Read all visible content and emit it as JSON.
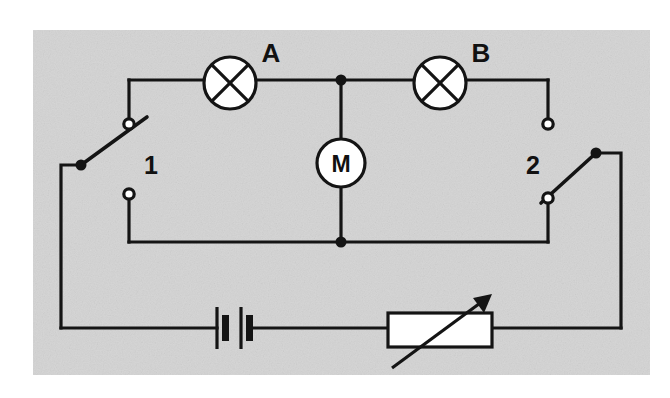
{
  "figure": {
    "kind": "electrical-circuit-schematic",
    "background_color": "#ffffff",
    "panel_color": "#d3d3d3",
    "line_color": "#141414",
    "component_fill": "#ffffff",
    "panel": {
      "x": 33,
      "y": 30,
      "width": 617,
      "height": 345
    }
  },
  "labels": {
    "lamp_a": "A",
    "lamp_b": "B",
    "motor": "M",
    "switch_one": "1",
    "switch_two": "2"
  },
  "components": {
    "lamp_a": {
      "name": "lamp-a",
      "symbol": "lamp",
      "label": "A",
      "center_x": 230,
      "center_y": 83,
      "radius": 26,
      "label_x": 271,
      "label_y": 60
    },
    "lamp_b": {
      "name": "lamp-b",
      "symbol": "lamp",
      "label": "B",
      "center_x": 440,
      "center_y": 83,
      "radius": 26,
      "label_x": 481,
      "label_y": 60
    },
    "motor": {
      "name": "motor",
      "symbol": "motor",
      "label": "M",
      "center_x": 341,
      "center_y": 163,
      "radius": 24,
      "label_x": 341,
      "label_y": 172
    },
    "battery": {
      "name": "battery",
      "symbol": "battery-two-cell",
      "center_x": 233,
      "center_y": 328,
      "long_plate_half_height": 21,
      "short_plate_half_height": 13,
      "plate_x": [
        216,
        224,
        241,
        249
      ]
    },
    "rheostat": {
      "name": "rheostat",
      "symbol": "variable-resistor",
      "x": 388,
      "y": 313,
      "width": 104,
      "height": 34,
      "arrow_from_x": 392,
      "arrow_from_y": 368,
      "arrow_to_x": 491,
      "arrow_to_y": 295
    },
    "switch_one": {
      "name": "switch-1",
      "symbol": "spdt-switch",
      "label": "1",
      "label_x": 144,
      "label_y": 172,
      "pivot_x": 81,
      "pivot_y": 165,
      "blade_tip_x": 146,
      "blade_tip_y": 118,
      "upper_terminal_x": 129,
      "upper_terminal_y": 124,
      "lower_terminal_x": 129,
      "lower_terminal_y": 194,
      "terminal_radius": 5
    },
    "switch_two": {
      "name": "switch-2",
      "symbol": "spdt-switch",
      "label": "2",
      "label_x": 535,
      "label_y": 172,
      "pivot_x": 596,
      "pivot_y": 153,
      "blade_tip_x": 543,
      "blade_tip_y": 202,
      "upper_terminal_x": 548,
      "upper_terminal_y": 124,
      "lower_terminal_x": 548,
      "lower_terminal_y": 198,
      "terminal_radius": 5
    }
  },
  "junction_dots": [
    {
      "name": "junction-top-motor",
      "x": 341,
      "y": 80
    },
    {
      "name": "junction-bottom-motor",
      "x": 341,
      "y": 242
    }
  ],
  "wires": {
    "top_rail_y": 80,
    "mid_rail_y": 242,
    "bottom_rail_y": 328,
    "left_bus_x": 61,
    "right_bus_x": 621,
    "branch_left_x": 129,
    "branch_right_x": 548,
    "motor_branch_x": 341,
    "segments": [
      {
        "name": "wire-top-left-to-lamp-a",
        "points": "129,80 204,80"
      },
      {
        "name": "wire-lamp-a-to-junction",
        "points": "256,80 341,80"
      },
      {
        "name": "wire-junction-to-lamp-b",
        "points": "341,80 414,80"
      },
      {
        "name": "wire-lamp-b-to-right",
        "points": "466,80 548,80"
      },
      {
        "name": "wire-left-branch-down",
        "points": "129,80 129,119"
      },
      {
        "name": "wire-right-branch-down",
        "points": "548,80 548,119"
      },
      {
        "name": "wire-motor-top-lead",
        "points": "341,80 341,139"
      },
      {
        "name": "wire-motor-bottom-lead",
        "points": "341,187 341,242"
      },
      {
        "name": "wire-mid-rail",
        "points": "129,242 548,242"
      },
      {
        "name": "wire-left-lower-terminal-down",
        "points": "129,199 129,242"
      },
      {
        "name": "wire-right-lower-terminal-down",
        "points": "548,203 548,242"
      },
      {
        "name": "wire-switch1-pivot-to-left-bus",
        "points": "81,165 61,165 61,328"
      },
      {
        "name": "wire-switch2-pivot-to-right-bus",
        "points": "596,153 621,153 621,328"
      },
      {
        "name": "wire-bottom-left-to-battery",
        "points": "61,328 216,328"
      },
      {
        "name": "wire-battery-to-rheostat",
        "points": "249,328 388,328"
      },
      {
        "name": "wire-rheostat-to-right-bus",
        "points": "492,328 621,328"
      }
    ]
  }
}
